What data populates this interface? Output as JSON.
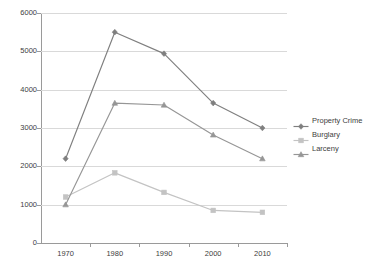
{
  "chart_data": {
    "type": "line",
    "title": "",
    "xlabel": "",
    "ylabel": "",
    "categories": [
      "1970",
      "1980",
      "1990",
      "2000",
      "2010"
    ],
    "ylim": [
      0,
      6000
    ],
    "yticks": [
      "0",
      "1000",
      "2000",
      "3000",
      "4000",
      "5000",
      "6000"
    ],
    "grid": "horizontal",
    "legend_position": "right",
    "series": [
      {
        "name": "Property Crime",
        "color": "#7f7f7f",
        "marker": "diamond",
        "values": [
          2200,
          5500,
          4940,
          3650,
          3000
        ]
      },
      {
        "name": "Burglary",
        "color": "#c3c3c3",
        "marker": "square",
        "values": [
          1200,
          1830,
          1320,
          850,
          800
        ]
      },
      {
        "name": "Larceny",
        "color": "#969696",
        "marker": "triangle",
        "values": [
          1000,
          3650,
          3600,
          2820,
          2200
        ]
      }
    ]
  },
  "legend": {
    "items": [
      {
        "label": "Property Crime"
      },
      {
        "label": "Burglary"
      },
      {
        "label": "Larceny"
      }
    ]
  },
  "axes": {
    "y": {
      "labels": [
        "6000",
        "5000",
        "4000",
        "3000",
        "2000",
        "1000",
        "0"
      ]
    },
    "x": {
      "labels": [
        "1970",
        "1980",
        "1990",
        "2000",
        "2010"
      ]
    }
  }
}
